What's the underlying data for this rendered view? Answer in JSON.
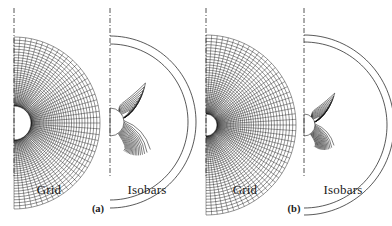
{
  "figure": {
    "kind": "cfd-flowfield-comparison",
    "background_color": "#ffffff",
    "line_color": "#111111",
    "axis_color": "#2a2a2a"
  },
  "panels": [
    {
      "id": "a-grid",
      "label": "Grid",
      "case": "a",
      "type": "mesh",
      "axis": "symmetry-axis-dash-dot",
      "body": "half-circle-white",
      "radial_lines": 46,
      "circumferential_lines": 40
    },
    {
      "id": "a-isobars",
      "label": "Isobars",
      "case": "a",
      "type": "contour",
      "axis": "symmetry-axis-dash-dot",
      "body": "half-circle-white",
      "contour_count": 26
    },
    {
      "id": "b-grid",
      "label": "Grid",
      "case": "b",
      "type": "mesh",
      "axis": "symmetry-axis-dash-dot",
      "body": "half-circle-white",
      "radial_lines": 50,
      "circumferential_lines": 44
    },
    {
      "id": "b-isobars",
      "label": "Isobars",
      "case": "b",
      "type": "contour",
      "axis": "symmetry-axis-dash-dot",
      "body": "half-circle-white",
      "contour_count": 28
    }
  ],
  "labels": {
    "grid_a": "Grid",
    "isobars_a": "Isobars",
    "grid_b": "Grid",
    "isobars_b": "Isobars"
  },
  "subcaptions": {
    "a": "(a)",
    "b": "(b)"
  }
}
